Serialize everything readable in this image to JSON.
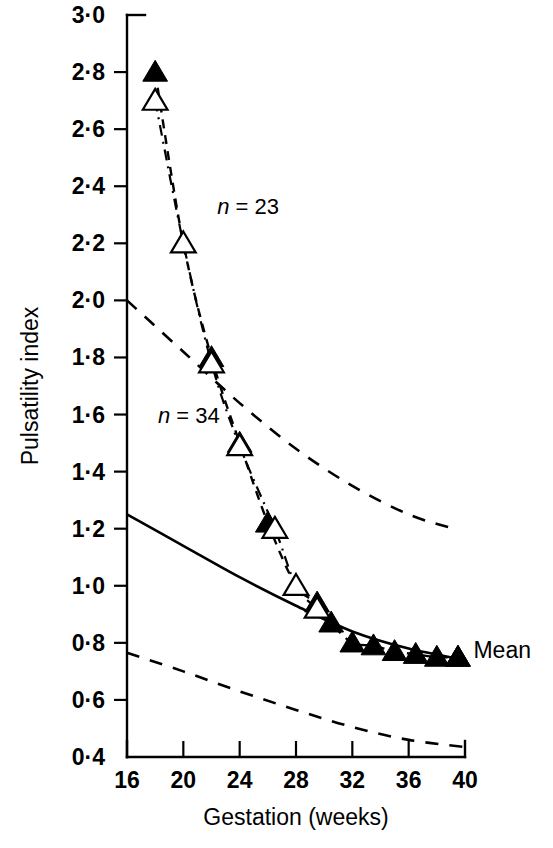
{
  "chart_data": {
    "type": "line",
    "title": "",
    "xlabel": "Gestation (weeks)",
    "ylabel": "Pulsatility index",
    "xlim": [
      16,
      40
    ],
    "ylim": [
      0.4,
      3.0
    ],
    "xticks": [
      "16",
      "20",
      "24",
      "28",
      "32",
      "36",
      "40"
    ],
    "xtick_values": [
      16,
      20,
      24,
      28,
      32,
      36,
      40
    ],
    "yticks": [
      "3·0",
      "2·8",
      "2·6",
      "2·4",
      "2·2",
      "2·0",
      "1·8",
      "1·6",
      "1·4",
      "1·2",
      "1·0",
      "0·8",
      "0·6",
      "0·4"
    ],
    "ytick_values": [
      3.0,
      2.8,
      2.6,
      2.4,
      2.2,
      2.0,
      1.8,
      1.6,
      1.4,
      1.2,
      1.0,
      0.8,
      0.6,
      0.4
    ],
    "grid": false,
    "legend_position": "none",
    "annotations": [
      {
        "text": "n = 23",
        "x": 22.4,
        "y": 2.33
      },
      {
        "text": "n = 34",
        "x": 18.2,
        "y": 1.6
      },
      {
        "text": "Mean",
        "x": 40.6,
        "y": 0.775
      }
    ],
    "series": [
      {
        "name": "filled-triangles",
        "marker": "filled-triangle",
        "linestyle": "dashed",
        "x": [
          18,
          20,
          22,
          24,
          26,
          28,
          29.5,
          30.5,
          32,
          33.5,
          35,
          36.5,
          38,
          39.5
        ],
        "y": [
          2.8,
          2.2,
          1.8,
          1.5,
          1.22,
          1.0,
          0.94,
          0.87,
          0.8,
          0.79,
          0.77,
          0.76,
          0.75,
          0.75
        ]
      },
      {
        "name": "open-triangles",
        "marker": "open-triangle",
        "linestyle": "dash-dot",
        "x": [
          18,
          20,
          22,
          24,
          26.5,
          28,
          29.5
        ],
        "y": [
          2.7,
          2.2,
          1.78,
          1.49,
          1.2,
          1.0,
          0.92
        ]
      }
    ],
    "reference_curves": [
      {
        "name": "upper-limit",
        "linestyle": "dashed",
        "points": [
          [
            16,
            2.0
          ],
          [
            20,
            1.82
          ],
          [
            24,
            1.64
          ],
          [
            28,
            1.48
          ],
          [
            32,
            1.35
          ],
          [
            36,
            1.25
          ],
          [
            39.2,
            1.2
          ]
        ]
      },
      {
        "name": "mean-line",
        "linestyle": "solid",
        "points": [
          [
            16,
            1.25
          ],
          [
            20,
            1.14
          ],
          [
            24,
            1.03
          ],
          [
            28,
            0.93
          ],
          [
            32,
            0.84
          ],
          [
            36,
            0.78
          ],
          [
            40,
            0.74
          ]
        ]
      },
      {
        "name": "lower-limit",
        "linestyle": "dashed",
        "points": [
          [
            16,
            0.765
          ],
          [
            20,
            0.7
          ],
          [
            24,
            0.63
          ],
          [
            28,
            0.565
          ],
          [
            32,
            0.505
          ],
          [
            36,
            0.46
          ],
          [
            40,
            0.435
          ]
        ]
      }
    ]
  },
  "axes": {
    "y_axis_name": "Pulsatility index",
    "x_axis_name": "Gestation (weeks)"
  }
}
